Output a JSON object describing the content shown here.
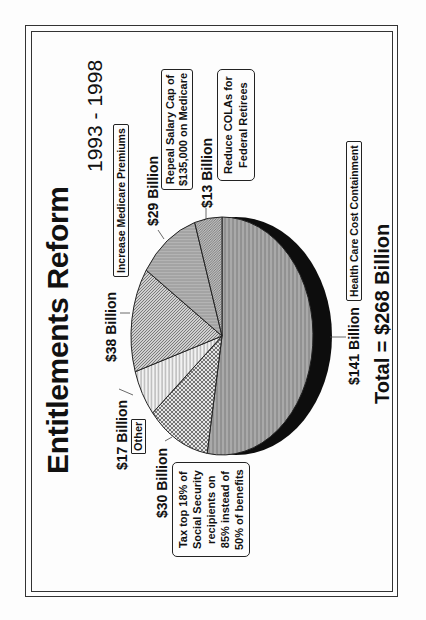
{
  "chart_data": {
    "type": "pie",
    "title": "Entitlements Reform",
    "subtitle": "1993 - 1998",
    "orientation": "rotated -90deg (landscape slide shown in portrait)",
    "unit": "Billion USD",
    "total_label": "Total = $268 Billion",
    "total": 268,
    "slices": [
      {
        "label": "Health Care Cost Containment",
        "value": 141,
        "value_label": "$141 Billion",
        "pattern": "vertical-stripes-gray"
      },
      {
        "label": "Tax top 18% of Social Security recipients on 85% instead of 50% of benefits",
        "value": 30,
        "value_label": "$30 Billion",
        "pattern": "crosshatch"
      },
      {
        "label": "Other",
        "value": 17,
        "value_label": "$17 Billion",
        "pattern": "vertical-lines-light"
      },
      {
        "label": "Increase Medicare Premiums",
        "value": 38,
        "value_label": "$38 Billion",
        "pattern": "diagonal-hatch"
      },
      {
        "label": "Repeal Salary Cap of $135,000 on Medicare",
        "value": 29,
        "value_label": "$29 Billion",
        "pattern": "horizontal-lines"
      },
      {
        "label": "Reduce COLAs for Federal Retirees",
        "value": 13,
        "value_label": "$13 Billion",
        "pattern": "diagonal-hatch-dense"
      }
    ],
    "legend": "none (callout labels)",
    "grid": false,
    "has_3d_shadow": true
  },
  "page": {
    "title": "Entitlements Reform",
    "years": "1993 - 1998",
    "total": "Total = $268 Billion"
  },
  "labels": {
    "health_value": "$141 Billion",
    "health_desc": "Health Care Cost Containment",
    "tax_value": "$30 Billion",
    "tax_line1": "Tax top 18% of",
    "tax_line2": "Social Security",
    "tax_line3": "recipients on",
    "tax_line4": "85% instead of",
    "tax_line5": "50% of benefits",
    "other_value": "$17 Billion",
    "other_desc": "Other",
    "medicare_value": "$38 Billion",
    "medicare_desc": "Increase Medicare Premiums",
    "salary_value": "$29 Billion",
    "salary_line1": "Repeal Salary Cap of",
    "salary_line2": "$135,000 on Medicare",
    "cola_value": "$13 Billion",
    "cola_line1": "Reduce COLAs for",
    "cola_line2": "Federal Retirees"
  }
}
